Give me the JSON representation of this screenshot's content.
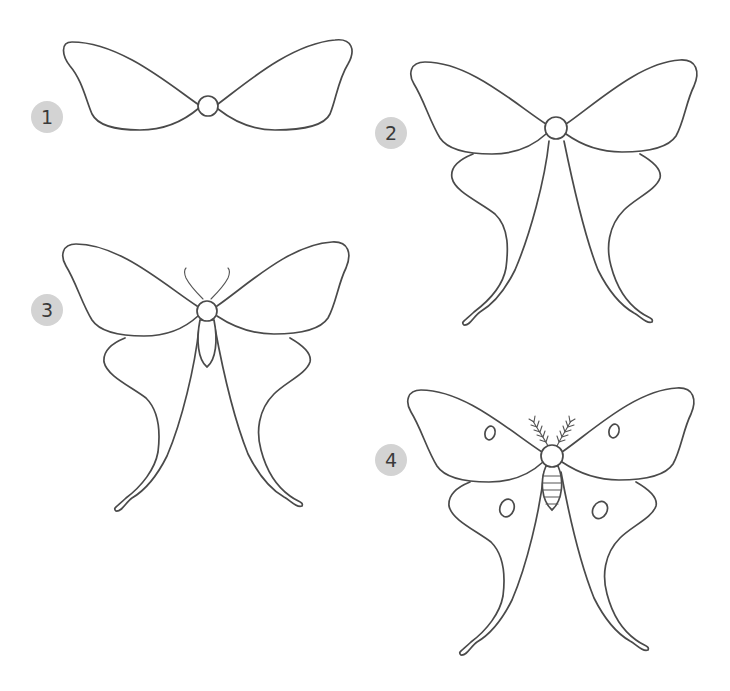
{
  "steps": [
    {
      "number": "1",
      "description": "Draw the body circle and the two upper (fore) wings"
    },
    {
      "number": "2",
      "description": "Add the long tailed hind wings"
    },
    {
      "number": "3",
      "description": "Add the antennae and the abdomen"
    },
    {
      "number": "4",
      "description": "Add feathered antennae, abdomen stripes and eye spots on the wings"
    }
  ],
  "colors": {
    "badge": "#d3d3d3",
    "badge_text": "#3a3a3a",
    "line": "#4a4a4a",
    "background": "#ffffff"
  }
}
